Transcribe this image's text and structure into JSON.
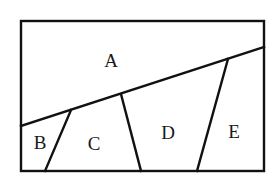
{
  "diagram": {
    "type": "region-partition",
    "stroke_color": "#111111",
    "background": "#ffffff",
    "outer_rect": {
      "x1": 21,
      "y1": 21,
      "x2": 264,
      "y2": 171
    },
    "lines": [
      {
        "id": "diagonal",
        "x1": 21,
        "y1": 126,
        "x2": 264,
        "y2": 47
      },
      {
        "id": "b-c-divider",
        "x1": 71,
        "y1": 110,
        "x2": 45,
        "y2": 171
      },
      {
        "id": "c-d-divider",
        "x1": 121,
        "y1": 94,
        "x2": 141,
        "y2": 171
      },
      {
        "id": "d-e-divider",
        "x1": 228,
        "y1": 59,
        "x2": 197,
        "y2": 171
      }
    ],
    "regions": [
      {
        "label": "A",
        "x": 111,
        "y": 60
      },
      {
        "label": "B",
        "x": 40,
        "y": 142
      },
      {
        "label": "C",
        "x": 94,
        "y": 143
      },
      {
        "label": "D",
        "x": 168,
        "y": 132
      },
      {
        "label": "E",
        "x": 234,
        "y": 131
      }
    ]
  }
}
